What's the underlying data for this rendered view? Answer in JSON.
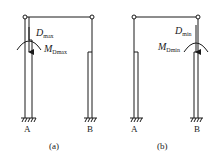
{
  "diagrams": [
    {
      "id": "a",
      "caption": "(a)",
      "supports": [
        "A",
        "B"
      ],
      "loaded_column": "A",
      "force_label": {
        "main": "D",
        "sub": "max"
      },
      "moment_label": {
        "main": "M",
        "sub": "Dmax"
      }
    },
    {
      "id": "b",
      "caption": "(b)",
      "supports": [
        "A",
        "B"
      ],
      "loaded_column": "B",
      "force_label": {
        "main": "D",
        "sub": "min"
      },
      "moment_label": {
        "main": "M",
        "sub": "Dmin"
      }
    }
  ],
  "colors": {
    "line": "#1a1a1a",
    "background": "#ffffff"
  }
}
